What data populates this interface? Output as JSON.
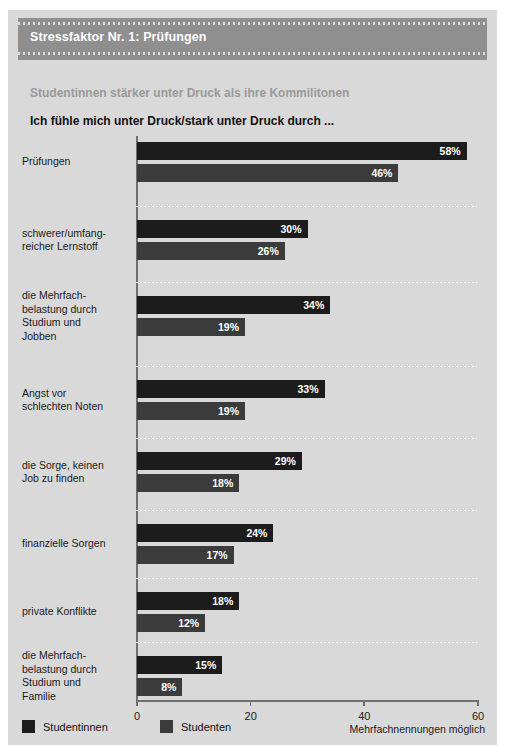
{
  "header": {
    "title": "Stressfaktor Nr. 1: Prüfungen",
    "band_color": "#8f8f8f"
  },
  "subtitle": "Studentinnen stärker unter Druck als ihre Kommilitonen",
  "question": "Ich fühle mich unter Druck/stark unter Druck durch ...",
  "legend": {
    "women_label": "Studentinnen",
    "men_label": "Studenten",
    "women_color": "#1c1c1c",
    "men_color": "#3b3b3b"
  },
  "footnote": "Mehrfachnennungen möglich",
  "chart_data": {
    "type": "bar",
    "orientation": "horizontal",
    "title": "Stressfaktor Nr. 1: Prüfungen",
    "subtitle": "Studentinnen stärker unter Druck als ihre Kommilitonen",
    "xlabel": "",
    "ylabel": "",
    "xlim": [
      0,
      60
    ],
    "xticks": [
      0,
      20,
      40,
      60
    ],
    "xtick_labels": [
      "0",
      "20",
      "40",
      "60"
    ],
    "grid": false,
    "legend_position": "bottom-left",
    "categories": [
      "Prüfungen",
      "schwerer/umfangreicher Lernstoff",
      "die Mehrfachbelastung durch Studium und Jobben",
      "Angst vor schlechten Noten",
      "die Sorge, keinen Job zu finden",
      "finanzielle Sorgen",
      "private Konflikte",
      "die Mehrfachbelastung durch Studium und Familie"
    ],
    "category_lines": [
      [
        "Prüfungen"
      ],
      [
        "schwerer/umfang-",
        "reicher Lernstoff"
      ],
      [
        "die Mehrfach-",
        "belastung durch",
        "Studium und",
        "Jobben"
      ],
      [
        "Angst vor",
        "schlechten Noten"
      ],
      [
        "die Sorge, keinen",
        "Job zu finden"
      ],
      [
        "finanzielle Sorgen"
      ],
      [
        "private Konflikte"
      ],
      [
        "die Mehrfach-",
        "belastung durch",
        "Studium und",
        "Familie"
      ]
    ],
    "series": [
      {
        "name": "Studentinnen",
        "color": "#1c1c1c",
        "values": [
          58,
          30,
          34,
          33,
          29,
          24,
          18,
          15
        ],
        "labels": [
          "58%",
          "30%",
          "34%",
          "33%",
          "29%",
          "24%",
          "18%",
          "15%"
        ]
      },
      {
        "name": "Studenten",
        "color": "#3b3b3b",
        "values": [
          46,
          26,
          19,
          19,
          18,
          17,
          12,
          8
        ],
        "labels": [
          "46%",
          "26%",
          "19%",
          "19%",
          "18%",
          "17%",
          "12%",
          "8%"
        ]
      }
    ],
    "unit": "%"
  }
}
